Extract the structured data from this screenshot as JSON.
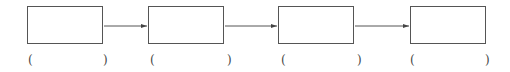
{
  "diagram": {
    "type": "flow-chain",
    "boxes": [
      {
        "label": ""
      },
      {
        "label": ""
      },
      {
        "label": ""
      },
      {
        "label": ""
      }
    ],
    "blanks": [
      {
        "open": "(",
        "close": ")",
        "value": ""
      },
      {
        "open": "(",
        "close": ")",
        "value": ""
      },
      {
        "open": "(",
        "close": ")",
        "value": ""
      },
      {
        "open": "(",
        "close": ")",
        "value": ""
      }
    ],
    "colors": {
      "stroke": "#555555",
      "background": "#ffffff"
    }
  }
}
